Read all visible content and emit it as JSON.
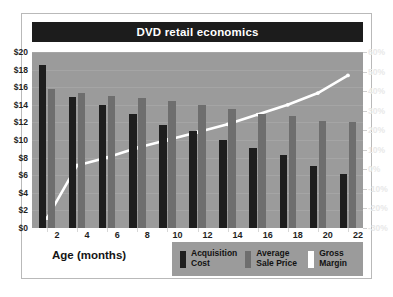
{
  "header": {
    "title": "DVD retail economics"
  },
  "axis": {
    "x_title": "Age (months)",
    "left_ticks": [
      "$0",
      "$2",
      "$4",
      "$6",
      "$8",
      "$10",
      "$12",
      "$14",
      "$16",
      "$18",
      "$20"
    ],
    "right_ticks": [
      "-30%",
      "-20%",
      "-10%",
      "0%",
      "10%",
      "20%",
      "30%",
      "40%",
      "50%",
      "60%"
    ]
  },
  "legend": {
    "items": [
      {
        "label": "Acquisition\nCost",
        "color": "#1e1e1e",
        "name": "acquisition-cost"
      },
      {
        "label": "Average\nSale Price",
        "color": "#6e6e6e",
        "name": "average-sale-price"
      },
      {
        "label": "Gross\nMargin",
        "color": "#ffffff",
        "name": "gross-margin"
      }
    ]
  },
  "colors": {
    "page_background": "#ffffff",
    "frame_border": "#b9b9b9",
    "title_bar": "#1c1c1c",
    "title_text": "#ffffff",
    "plot_background": "#9b9b9b",
    "bar_cost": "#1e1e1e",
    "bar_price": "#6e6e6e",
    "line_margin": "#ffffff",
    "left_axis_text": "#1f1f1f",
    "right_axis_text": "#e8e8e8"
  },
  "chart_data": {
    "type": "bar",
    "title": "DVD retail economics",
    "xlabel": "Age (months)",
    "ylabel": "",
    "categories": [
      2,
      4,
      6,
      8,
      10,
      12,
      14,
      16,
      18,
      20,
      22
    ],
    "ylim": [
      0,
      20
    ],
    "y2lim": [
      -30,
      60
    ],
    "grid": false,
    "legend_position": "bottom-right",
    "series": [
      {
        "name": "Acquisition Cost",
        "type": "bar",
        "axis": "left",
        "unit": "$",
        "color": "#1e1e1e",
        "values": [
          18.5,
          14.9,
          14.0,
          13.0,
          11.7,
          11.0,
          10.0,
          9.1,
          8.3,
          7.1,
          6.1
        ]
      },
      {
        "name": "Average Sale Price",
        "type": "bar",
        "axis": "left",
        "unit": "$",
        "color": "#6e6e6e",
        "values": [
          15.8,
          15.3,
          15.0,
          14.8,
          14.4,
          14.0,
          13.5,
          13.0,
          12.7,
          12.2,
          12.0
        ]
      },
      {
        "name": "Gross Margin",
        "type": "line",
        "axis": "right",
        "unit": "%",
        "color": "#ffffff",
        "values": [
          -25,
          2,
          6,
          11,
          15,
          19,
          23,
          28,
          33,
          39,
          48
        ]
      }
    ]
  }
}
